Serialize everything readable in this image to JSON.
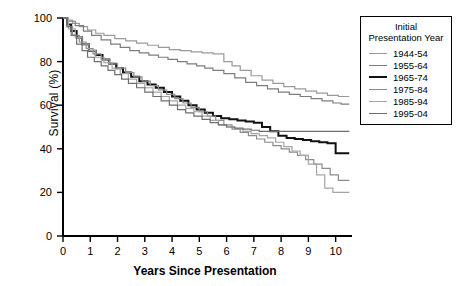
{
  "chart_data": {
    "type": "line",
    "title": "",
    "xlabel": "Years Since Presentation",
    "ylabel": "Survival (%)",
    "xlim": [
      0,
      10.6
    ],
    "ylim": [
      0,
      100
    ],
    "xticks": [
      "0",
      "1",
      "2",
      "3",
      "4",
      "5",
      "6",
      "7",
      "8",
      "9",
      "10"
    ],
    "yticks": [
      "0",
      "20",
      "40",
      "60",
      "80",
      "100"
    ],
    "grid": false,
    "legend_position": "top-right",
    "legend_title_line1": "Initial",
    "legend_title_line2": "Presentation Year",
    "series": [
      {
        "name": "1944-54",
        "color": "#9a9a9a",
        "width": 1.2,
        "points": [
          [
            0,
            100
          ],
          [
            0.15,
            99
          ],
          [
            0.35,
            97.5
          ],
          [
            0.6,
            96
          ],
          [
            0.9,
            94.5
          ],
          [
            1.2,
            93
          ],
          [
            1.5,
            92
          ],
          [
            1.9,
            90.5
          ],
          [
            2.3,
            89.5
          ],
          [
            2.7,
            88.5
          ],
          [
            3.1,
            87.5
          ],
          [
            3.5,
            86.5
          ],
          [
            3.9,
            85.5
          ],
          [
            4.3,
            85
          ],
          [
            4.7,
            84.5
          ],
          [
            5.1,
            84
          ],
          [
            5.5,
            83.5
          ],
          [
            5.9,
            80
          ],
          [
            6.2,
            78
          ],
          [
            6.5,
            76
          ],
          [
            6.9,
            73.5
          ],
          [
            7.3,
            71.5
          ],
          [
            7.7,
            70
          ],
          [
            8.1,
            68.5
          ],
          [
            8.5,
            67.5
          ],
          [
            8.9,
            66.5
          ],
          [
            9.3,
            65.5
          ],
          [
            9.7,
            64.5
          ],
          [
            10.1,
            64
          ],
          [
            10.5,
            64
          ]
        ]
      },
      {
        "name": "1955-64",
        "color": "#7d7d7d",
        "width": 1.2,
        "points": [
          [
            0,
            100
          ],
          [
            0.2,
            98.5
          ],
          [
            0.45,
            96.5
          ],
          [
            0.75,
            94
          ],
          [
            1.05,
            92
          ],
          [
            1.4,
            90
          ],
          [
            1.75,
            88
          ],
          [
            2.1,
            86.5
          ],
          [
            2.45,
            85
          ],
          [
            2.8,
            84
          ],
          [
            3.15,
            83
          ],
          [
            3.5,
            82
          ],
          [
            3.85,
            81
          ],
          [
            4.2,
            80
          ],
          [
            4.55,
            79
          ],
          [
            4.9,
            78
          ],
          [
            5.2,
            77
          ],
          [
            5.5,
            76
          ],
          [
            5.9,
            74.5
          ],
          [
            6.3,
            72.5
          ],
          [
            6.7,
            70.5
          ],
          [
            7.1,
            69
          ],
          [
            7.5,
            67.5
          ],
          [
            7.9,
            66
          ],
          [
            8.3,
            65
          ],
          [
            8.7,
            64
          ],
          [
            9.1,
            63
          ],
          [
            9.5,
            62
          ],
          [
            9.9,
            61
          ],
          [
            10.2,
            60.5
          ],
          [
            10.5,
            60.5
          ]
        ]
      },
      {
        "name": "1965-74",
        "color": "#111111",
        "width": 2.0,
        "points": [
          [
            0,
            100
          ],
          [
            0.15,
            97
          ],
          [
            0.3,
            94
          ],
          [
            0.5,
            91
          ],
          [
            0.7,
            88
          ],
          [
            0.95,
            85
          ],
          [
            1.2,
            83
          ],
          [
            1.45,
            81
          ],
          [
            1.7,
            79
          ],
          [
            1.95,
            77
          ],
          [
            2.2,
            75
          ],
          [
            2.5,
            73
          ],
          [
            2.8,
            71
          ],
          [
            3.1,
            69.5
          ],
          [
            3.4,
            68
          ],
          [
            3.7,
            66
          ],
          [
            4.0,
            64
          ],
          [
            4.3,
            62
          ],
          [
            4.6,
            60
          ],
          [
            4.9,
            58
          ],
          [
            5.2,
            56.5
          ],
          [
            5.5,
            55
          ],
          [
            5.8,
            54
          ],
          [
            6.1,
            53.5
          ],
          [
            6.4,
            53
          ],
          [
            6.7,
            52.5
          ],
          [
            7.0,
            52
          ],
          [
            7.3,
            50
          ],
          [
            7.6,
            48
          ],
          [
            7.9,
            46
          ],
          [
            8.2,
            45
          ],
          [
            8.5,
            44.5
          ],
          [
            8.8,
            44
          ],
          [
            9.1,
            43.5
          ],
          [
            9.4,
            43
          ],
          [
            9.7,
            42.5
          ],
          [
            10.0,
            38
          ],
          [
            10.3,
            38
          ],
          [
            10.5,
            38
          ]
        ]
      },
      {
        "name": "1975-84",
        "color": "#8c8c8c",
        "width": 1.2,
        "points": [
          [
            0,
            100
          ],
          [
            0.15,
            96
          ],
          [
            0.35,
            92
          ],
          [
            0.6,
            89
          ],
          [
            0.85,
            86
          ],
          [
            1.1,
            83.5
          ],
          [
            1.4,
            81
          ],
          [
            1.7,
            79
          ],
          [
            2.0,
            77
          ],
          [
            2.3,
            75
          ],
          [
            2.6,
            73
          ],
          [
            2.9,
            71
          ],
          [
            3.2,
            69
          ],
          [
            3.5,
            67
          ],
          [
            3.8,
            65
          ],
          [
            4.1,
            63
          ],
          [
            4.4,
            61
          ],
          [
            4.7,
            59
          ],
          [
            5.0,
            57
          ],
          [
            5.3,
            55
          ],
          [
            5.6,
            53
          ],
          [
            5.9,
            51
          ],
          [
            6.2,
            49
          ],
          [
            6.5,
            47.5
          ],
          [
            6.8,
            46
          ],
          [
            7.1,
            44.5
          ],
          [
            7.4,
            43
          ],
          [
            7.7,
            41.5
          ],
          [
            8.0,
            40
          ],
          [
            8.3,
            38.5
          ],
          [
            8.6,
            37
          ],
          [
            8.9,
            35
          ],
          [
            9.2,
            33
          ],
          [
            9.5,
            31
          ],
          [
            9.8,
            28
          ],
          [
            10.1,
            25.5
          ],
          [
            10.5,
            25.5
          ]
        ]
      },
      {
        "name": "1985-94",
        "color": "#a5a5a5",
        "width": 1.2,
        "points": [
          [
            0,
            100
          ],
          [
            0.2,
            95
          ],
          [
            0.45,
            91
          ],
          [
            0.7,
            88
          ],
          [
            0.95,
            85
          ],
          [
            1.2,
            82
          ],
          [
            1.5,
            79.5
          ],
          [
            1.8,
            77
          ],
          [
            2.1,
            74.5
          ],
          [
            2.4,
            72
          ],
          [
            2.7,
            70
          ],
          [
            3.0,
            68
          ],
          [
            3.3,
            66
          ],
          [
            3.6,
            64
          ],
          [
            3.9,
            62
          ],
          [
            4.2,
            60
          ],
          [
            4.5,
            58.5
          ],
          [
            4.8,
            57
          ],
          [
            5.1,
            55
          ],
          [
            5.4,
            53
          ],
          [
            5.7,
            51
          ],
          [
            6.0,
            50
          ],
          [
            6.3,
            49
          ],
          [
            6.6,
            48
          ],
          [
            6.9,
            47
          ],
          [
            7.2,
            46
          ],
          [
            7.5,
            45
          ],
          [
            7.8,
            43
          ],
          [
            8.1,
            41
          ],
          [
            8.4,
            39
          ],
          [
            8.7,
            37
          ],
          [
            9.0,
            33
          ],
          [
            9.3,
            28
          ],
          [
            9.6,
            22
          ],
          [
            9.9,
            20
          ],
          [
            10.2,
            20
          ],
          [
            10.5,
            20
          ]
        ]
      },
      {
        "name": "1995-04",
        "color": "#6e6e6e",
        "width": 1.2,
        "points": [
          [
            0,
            100
          ],
          [
            0.15,
            96
          ],
          [
            0.3,
            92
          ],
          [
            0.5,
            88
          ],
          [
            0.7,
            85
          ],
          [
            0.9,
            82
          ],
          [
            1.15,
            80
          ],
          [
            1.4,
            78
          ],
          [
            1.65,
            76
          ],
          [
            1.9,
            74
          ],
          [
            2.15,
            72
          ],
          [
            2.4,
            70
          ],
          [
            2.7,
            68
          ],
          [
            3.0,
            66
          ],
          [
            3.3,
            64
          ],
          [
            3.6,
            62
          ],
          [
            3.9,
            60
          ],
          [
            4.2,
            58
          ],
          [
            4.5,
            56.5
          ],
          [
            4.8,
            55
          ],
          [
            5.1,
            53.5
          ],
          [
            5.4,
            52
          ],
          [
            5.7,
            51
          ],
          [
            6.0,
            50
          ],
          [
            6.3,
            49.5
          ],
          [
            6.6,
            49
          ],
          [
            6.9,
            48.5
          ],
          [
            7.2,
            48
          ],
          [
            7.5,
            48
          ],
          [
            7.8,
            48
          ],
          [
            8.1,
            48
          ],
          [
            8.4,
            48
          ],
          [
            8.7,
            48
          ],
          [
            9.0,
            48
          ],
          [
            9.3,
            48
          ],
          [
            9.6,
            48
          ],
          [
            10.0,
            48
          ],
          [
            10.5,
            48
          ]
        ]
      }
    ]
  }
}
